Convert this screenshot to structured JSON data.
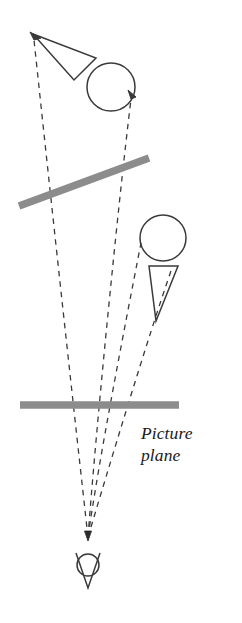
{
  "figure": {
    "background_color": "#ffffff",
    "width": 242,
    "height": 623,
    "caption": {
      "line1": "Picture",
      "line2": "plane",
      "full_text": "Picture plane",
      "style": "italic serif",
      "color": "#1a1a1a"
    },
    "colors": {
      "outline": "#3a3a3a",
      "bar_gray": "#8c8c8c",
      "dash": "#3a3a3a",
      "text": "#1a1a1a"
    },
    "elements": {
      "object_triangle": {
        "name": "Object triangle (arrow-like)",
        "points": "33,34 96,58 74,80",
        "stroke": "#3a3a3a",
        "fill": "none"
      },
      "object_circle": {
        "name": "Object circle",
        "cx": 111,
        "cy": 87,
        "r": 24,
        "stroke": "#3a3a3a",
        "fill": "none"
      },
      "tilted_plane": {
        "name": "Tilted object plane",
        "x1": 19,
        "y1": 206,
        "x2": 149,
        "y2": 158,
        "stroke": "#8c8c8c",
        "width": 7
      },
      "projected_circle": {
        "name": "Projected circle",
        "cx": 163,
        "cy": 238,
        "r": 23,
        "stroke": "#3a3a3a",
        "fill": "none"
      },
      "projected_triangle": {
        "name": "Projected triangle",
        "points": "149,266 178,266 156,321",
        "stroke": "#3a3a3a",
        "fill": "none"
      },
      "picture_plane_bar": {
        "name": "Picture plane",
        "x1": 20,
        "y1": 405,
        "x2": 179,
        "y2": 405,
        "stroke": "#8c8c8c",
        "width": 7
      },
      "eye": {
        "name": "Viewer eye",
        "cx": 88,
        "cy": 565,
        "r": 11,
        "v_points": "76,554 88,587 100,554",
        "stroke": "#3a3a3a"
      },
      "convergence_point": {
        "x": 88,
        "y": 537
      }
    },
    "sight_lines": [
      {
        "id": "ray-1",
        "label": "Ray to object triangle apex",
        "from_x": 88,
        "from_y": 537,
        "to_x": 34,
        "to_y": 36,
        "arrow": true
      },
      {
        "id": "ray-2",
        "label": "Ray to object circle edge",
        "from_x": 88,
        "from_y": 537,
        "to_x": 132,
        "to_y": 95,
        "arrow": true
      },
      {
        "id": "ray-3",
        "label": "Ray to projected circle edge",
        "from_x": 88,
        "from_y": 537,
        "to_x": 141,
        "to_y": 243,
        "arrow": false
      },
      {
        "id": "ray-4",
        "label": "Ray to projected triangle edge",
        "from_x": 88,
        "from_y": 537,
        "to_x": 172,
        "to_y": 268,
        "arrow": false
      }
    ]
  }
}
